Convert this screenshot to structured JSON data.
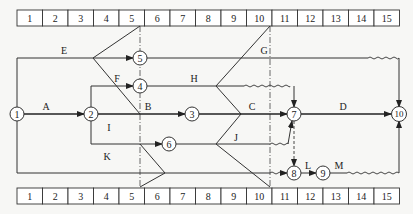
{
  "diagram": {
    "type": "time-scaled network diagram (double-code) with check lines",
    "timescale": {
      "top": [
        "1",
        "2",
        "3",
        "4",
        "5",
        "6",
        "7",
        "8",
        "9",
        "10",
        "11",
        "12",
        "13",
        "14",
        "15"
      ],
      "bottom": [
        "1",
        "2",
        "3",
        "4",
        "5",
        "6",
        "7",
        "8",
        "9",
        "10",
        "11",
        "12",
        "13",
        "14",
        "15"
      ]
    },
    "check_lines": [
      {
        "name": "check-line-5",
        "at_end_of_period": 5
      },
      {
        "name": "check-line-10",
        "at_end_of_period": 10
      }
    ],
    "nodes": [
      {
        "id": "1",
        "label": "1"
      },
      {
        "id": "2",
        "label": "2"
      },
      {
        "id": "3",
        "label": "3"
      },
      {
        "id": "4",
        "label": "4"
      },
      {
        "id": "5",
        "label": "5"
      },
      {
        "id": "6",
        "label": "6"
      },
      {
        "id": "7",
        "label": "7"
      },
      {
        "id": "8",
        "label": "8"
      },
      {
        "id": "9",
        "label": "9"
      },
      {
        "id": "10",
        "label": "10"
      }
    ],
    "activities": [
      {
        "label": "A",
        "from": "1",
        "to": "2",
        "critical": true
      },
      {
        "label": "B",
        "from": "2",
        "to": "3",
        "critical": true
      },
      {
        "label": "C",
        "from": "3",
        "to": "7",
        "critical": true
      },
      {
        "label": "D",
        "from": "7",
        "to": "10",
        "critical": true
      },
      {
        "label": "E",
        "from": "1",
        "to": "5"
      },
      {
        "label": "F",
        "from": "2",
        "to": "4"
      },
      {
        "label": "G",
        "from": "5",
        "to": "10",
        "free_float": true
      },
      {
        "label": "H",
        "from": "4",
        "to": "7",
        "free_float": true
      },
      {
        "label": "I",
        "from": "2",
        "to": "6"
      },
      {
        "label": "J",
        "from": "6",
        "to": "7",
        "free_float": true
      },
      {
        "label": "K",
        "from": "1",
        "to": "8",
        "free_float": true
      },
      {
        "label": "L",
        "from": "8",
        "to": "9"
      },
      {
        "label": "M",
        "from": "9",
        "to": "10",
        "free_float": true
      },
      {
        "label": "",
        "from": "7",
        "to": "8",
        "dummy": true
      }
    ],
    "labels": {
      "A": "A",
      "B": "B",
      "C": "C",
      "D": "D",
      "E": "E",
      "F": "F",
      "G": "G",
      "H": "H",
      "I": "I",
      "J": "J",
      "K": "K",
      "L": "L",
      "M": "M"
    }
  }
}
